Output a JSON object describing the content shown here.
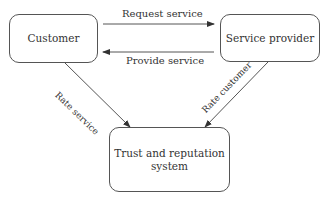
{
  "diagram": {
    "nodes": {
      "customer": "Customer",
      "provider": "Service provider",
      "trust_line1": "Trust and reputation",
      "trust_line2": "system"
    },
    "edges": {
      "request": "Request service",
      "provide": "Provide service",
      "rate_service": "Rate service",
      "rate_customer": "Rate customer"
    },
    "colors": {
      "stroke": "#555555",
      "text": "#333333",
      "background": "#ffffff"
    }
  }
}
